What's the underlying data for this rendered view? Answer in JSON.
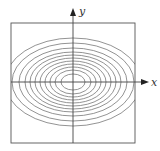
{
  "diagram": {
    "type": "contour-plot",
    "axes": {
      "x_label": "x",
      "y_label": "y"
    },
    "colors": {
      "line": "#555555",
      "contour": "#777777",
      "background": "#ffffff"
    },
    "box": {
      "left": 11,
      "top": 23,
      "right": 135,
      "bottom": 143
    },
    "origin": {
      "x": 73,
      "y": 82
    },
    "contours": [
      {
        "rx": 12,
        "ry": 8
      },
      {
        "rx": 18,
        "ry": 12
      },
      {
        "rx": 23,
        "ry": 15
      },
      {
        "rx": 28,
        "ry": 18
      },
      {
        "rx": 33,
        "ry": 21
      },
      {
        "rx": 38,
        "ry": 24
      },
      {
        "rx": 43,
        "ry": 27
      },
      {
        "rx": 48,
        "ry": 30
      },
      {
        "rx": 54,
        "ry": 34
      },
      {
        "rx": 61,
        "ry": 39
      },
      {
        "rx": 68,
        "ry": 44
      }
    ]
  }
}
